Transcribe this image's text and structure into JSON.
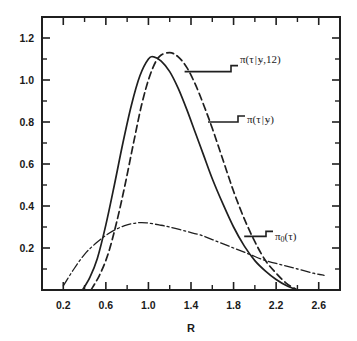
{
  "figure": {
    "background": "#ffffff",
    "ink_color": "#1f1f1f"
  },
  "chart_data": {
    "type": "line",
    "title": "",
    "subtitle": "",
    "xlabel": "R",
    "ylabel": "",
    "xlim": [
      0.0,
      2.8
    ],
    "ylim": [
      0.0,
      1.3
    ],
    "grid": false,
    "legend_position": "inline-annotations",
    "x_ticks": [
      0.2,
      0.6,
      1.0,
      1.4,
      1.8,
      2.2,
      2.6
    ],
    "x_tick_labels": [
      "0.2",
      "0.6",
      "1.0",
      "1.4",
      "1.8",
      "2.2",
      "2.6"
    ],
    "x_minor_ticks": [
      0.4,
      0.8,
      1.2,
      1.6,
      2.0,
      2.4
    ],
    "y_ticks": [
      0.2,
      0.4,
      0.6,
      0.8,
      1.0,
      1.2
    ],
    "y_tick_labels": [
      "0.2",
      "0.4",
      "0.6",
      "0.8",
      "1.0",
      "1.2"
    ],
    "y_minor_ticks": [
      0.1,
      0.3,
      0.5,
      0.7,
      0.9,
      1.1,
      1.3
    ],
    "series": [
      {
        "name": "pi(tau|y)",
        "label": "π(τ|y)",
        "style": "solid",
        "peak_x": 1.05,
        "peak_y": 1.11,
        "x": [
          0.38,
          0.45,
          0.52,
          0.6,
          0.68,
          0.76,
          0.84,
          0.92,
          1.0,
          1.05,
          1.12,
          1.2,
          1.28,
          1.36,
          1.44,
          1.52,
          1.6,
          1.7,
          1.8,
          1.9,
          2.0,
          2.1,
          2.2,
          2.3,
          2.4
        ],
        "y": [
          0.0,
          0.06,
          0.15,
          0.31,
          0.5,
          0.7,
          0.88,
          1.02,
          1.1,
          1.11,
          1.09,
          1.04,
          0.96,
          0.86,
          0.75,
          0.64,
          0.53,
          0.41,
          0.3,
          0.21,
          0.14,
          0.09,
          0.05,
          0.02,
          0.0
        ]
      },
      {
        "name": "pi(tau|y,12)",
        "label": "π(τ|y,12)",
        "style": "dashed",
        "peak_x": 1.2,
        "peak_y": 1.13,
        "x": [
          0.46,
          0.54,
          0.62,
          0.7,
          0.78,
          0.86,
          0.94,
          1.02,
          1.1,
          1.2,
          1.28,
          1.36,
          1.44,
          1.52,
          1.6,
          1.7,
          1.8,
          1.9,
          2.0,
          2.1,
          2.2,
          2.3,
          2.4
        ],
        "y": [
          0.0,
          0.07,
          0.17,
          0.32,
          0.5,
          0.7,
          0.89,
          1.03,
          1.11,
          1.13,
          1.11,
          1.06,
          0.98,
          0.88,
          0.77,
          0.62,
          0.47,
          0.34,
          0.23,
          0.14,
          0.08,
          0.03,
          0.0
        ]
      },
      {
        "name": "pi_0(tau)",
        "label": "π₀(τ)",
        "style": "dash-dot",
        "peak_x": 0.98,
        "peak_y": 0.32,
        "x": [
          0.2,
          0.3,
          0.4,
          0.5,
          0.6,
          0.7,
          0.8,
          0.9,
          0.98,
          1.1,
          1.2,
          1.35,
          1.5,
          1.65,
          1.8,
          1.95,
          2.1,
          2.25,
          2.4,
          2.55,
          2.65
        ],
        "y": [
          0.02,
          0.1,
          0.17,
          0.22,
          0.26,
          0.29,
          0.31,
          0.32,
          0.32,
          0.31,
          0.3,
          0.28,
          0.26,
          0.23,
          0.2,
          0.17,
          0.14,
          0.12,
          0.1,
          0.08,
          0.07
        ]
      }
    ],
    "annotations": [
      {
        "id": "ann-pi-tau-y-12",
        "text": "π(τ|y,12)",
        "pi": "π",
        "open": "(",
        "tau": "τ",
        "bar": "|",
        "y_var": "y",
        "tilde": "~",
        "rest": ",12)",
        "target_x": 1.34,
        "target_y": 1.04
      },
      {
        "id": "ann-pi-tau-y",
        "text": "π(τ|y)",
        "pi": "π",
        "open": "(",
        "tau": "τ",
        "bar": "|",
        "y_var": "y",
        "tilde": "~",
        "rest": ")",
        "target_x": 1.56,
        "target_y": 0.8
      },
      {
        "id": "ann-pi-0-tau",
        "text": "π₀(τ)",
        "pi": "π",
        "sub": "0",
        "rest": "(τ)",
        "target_x": 1.9,
        "target_y": 0.255
      }
    ]
  }
}
